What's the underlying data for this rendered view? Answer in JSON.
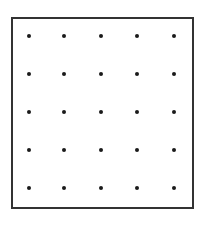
{
  "diagram": {
    "type": "dot-grid",
    "rows": 5,
    "cols": 5,
    "frame_color": "#333333",
    "dot_color": "#1a1a1a",
    "col_x": [
      29,
      64,
      101,
      137,
      174
    ],
    "row_y": [
      36,
      74,
      112,
      150,
      188
    ]
  }
}
